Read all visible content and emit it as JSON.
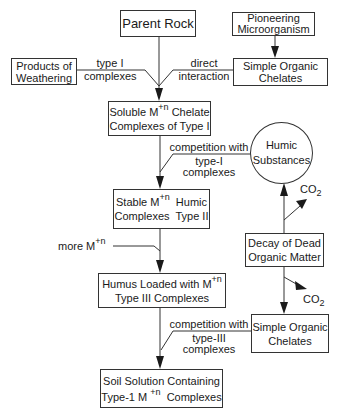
{
  "diagram": {
    "nodes": {
      "parent_rock": {
        "label": "Parent Rock"
      },
      "pioneering": {
        "line1": "Pioneering",
        "line2": "Microorganism"
      },
      "products_weathering": {
        "line1": "Products of",
        "line2": "Weathering"
      },
      "simple_chelates_top": {
        "line1": "Simple Organic",
        "line2": "Chelates"
      },
      "soluble": {
        "line1_pre": "Soluble M",
        "line1_sup": "+n",
        "line1_post": " Chelate",
        "line2": "Complexes of Type I"
      },
      "humic_substances": {
        "line1": "Humic",
        "line2": "Substances"
      },
      "stable": {
        "line1_pre": "Stable M",
        "line1_sup": "+n",
        "line1_post": "  Humic",
        "line2": "Complexes  Type II"
      },
      "decay": {
        "line1": "Decay of Dead",
        "line2": "Organic Matter"
      },
      "humus_loaded": {
        "line1_pre": "Humus Loaded with M",
        "line1_sup": "+n",
        "line2": "Type III Complexes"
      },
      "simple_chelates_bottom": {
        "line1": "Simple Organic",
        "line2": "Chelates"
      },
      "soil_solution": {
        "line1": "Soil Solution Containing",
        "line2_pre": "Type-1 M ",
        "line2_sup": "+n",
        "line2_post": "  Complexes"
      }
    },
    "edge_labels": {
      "type_i_complexes": {
        "line1": "type I",
        "line2": "complexes"
      },
      "direct_interaction": {
        "line1": "direct",
        "line2": "interaction"
      },
      "competition_type_i": {
        "line1": "competition with",
        "line2": "type-I",
        "line3": "complexes"
      },
      "co2_top": {
        "main": "CO",
        "sub": "2"
      },
      "more_m": {
        "pre": "more M",
        "sup": "+n"
      },
      "co2_bottom": {
        "main": "CO",
        "sub": "2"
      },
      "competition_type_iii": {
        "line1": "competition with",
        "line2": "type-III",
        "line3": "complexes"
      }
    }
  }
}
